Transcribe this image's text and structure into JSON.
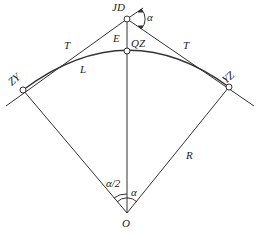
{
  "diagram": {
    "points": {
      "JD": {
        "label": "JD",
        "x": 127,
        "y": 19
      },
      "QZ": {
        "label": "QZ",
        "x": 127,
        "y": 51
      },
      "ZY": {
        "label": "ZY",
        "x": 23,
        "y": 90
      },
      "YZ": {
        "label": "YZ",
        "x": 229,
        "y": 87
      },
      "O": {
        "label": "O",
        "x": 127,
        "y": 213
      }
    },
    "labels": {
      "tangent_left": "T",
      "tangent_right": "T",
      "external": "E",
      "arc": "L",
      "radius": "R",
      "deflection_angle": "α",
      "half_angle": "α/2",
      "center_angle": "α"
    },
    "colors": {
      "line": "#333333",
      "text": "#222222",
      "background": "#ffffff"
    }
  }
}
